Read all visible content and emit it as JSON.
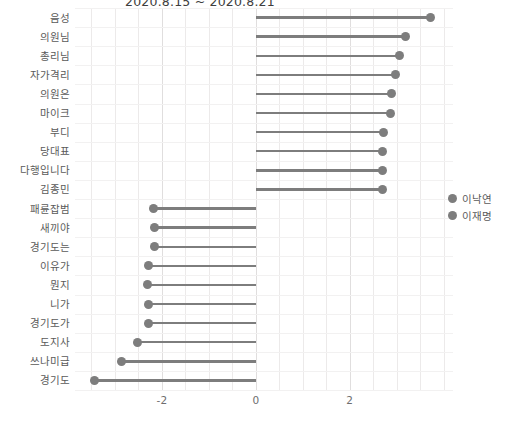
{
  "chart_data": {
    "type": "bar",
    "title": "2020.8.15 ~ 2020.8.21",
    "xlabel": "",
    "ylabel": "",
    "xlim": [
      -3.85,
      4.2
    ],
    "xticks": [
      -2,
      0,
      2
    ],
    "xticklabels": [
      "-2",
      "0",
      "2"
    ],
    "grid": true,
    "legend_position": "right",
    "orientation": "horizontal",
    "categories": [
      "음성",
      "의원님",
      "총리님",
      "자가격리",
      "의원은",
      "마이크",
      "부디",
      "당대표",
      "다행입니다",
      "김종민",
      "패륜잡범",
      "새끼야",
      "경기도는",
      "이유가",
      "뭔지",
      "니가",
      "경기도가",
      "도지사",
      "쓰나미급",
      "경기도"
    ],
    "values": [
      3.72,
      3.19,
      3.06,
      2.98,
      2.89,
      2.87,
      2.72,
      2.7,
      2.7,
      2.7,
      -2.17,
      -2.15,
      -2.15,
      -2.28,
      -2.3,
      -2.28,
      -2.28,
      -2.51,
      -2.85,
      -3.43
    ],
    "series": [
      {
        "name": "이낙연",
        "color": "#7d7d7d"
      },
      {
        "name": "이재명",
        "color": "#7d7d7d"
      }
    ],
    "legend": [
      "이낙연",
      "이재명"
    ],
    "marker_color": "#7d7d7d",
    "stem_color": "#7d7d7d"
  }
}
